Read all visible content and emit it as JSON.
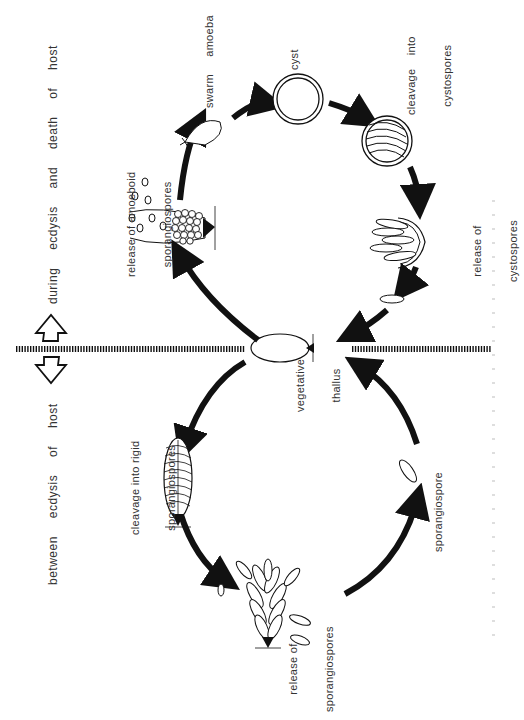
{
  "diagram": {
    "phases": {
      "upper": "during ecdysis and death of host",
      "lower": "between ecdysis of host"
    },
    "stages": {
      "vegetative_thallus": [
        "vegetative",
        "thallus"
      ],
      "release_amoeboid": [
        "release of amoeboid",
        "sporangiospores"
      ],
      "swarm_amoeba": "swarm amoeba",
      "cyst": "cyst",
      "cleavage_cystospores": [
        "cleavage into",
        "cystospores"
      ],
      "release_cystospores": [
        "release of",
        "cystospores"
      ],
      "cleavage_rigid": [
        "cleavage into rigid",
        "sporangiospores"
      ],
      "release_sporangiospores": [
        "release of",
        "sporangiospores"
      ],
      "sporangiospore": "sporangiospore"
    },
    "colors": {
      "ink": "#111111",
      "text": "#333333",
      "background": "#ffffff"
    }
  }
}
